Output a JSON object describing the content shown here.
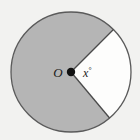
{
  "figure": {
    "type": "circle-sector-diagram",
    "background_color": "#f2f2f0",
    "labels": {
      "center_point": "O",
      "angle_variable": "x",
      "degree_symbol": "°",
      "angle_full": "x°"
    },
    "colors": {
      "shaded_sector_fill": "#b5b5b5",
      "unshaded_sector_fill": "#fdfdfc",
      "outline": "#5a5a5a",
      "radius_line": "#4a4a4a",
      "center_dot": "#111111",
      "label_text": "#1a1a1a"
    },
    "geometry": {
      "center_x": 71,
      "center_y": 72,
      "radius": 60,
      "unshaded_start_angle_deg": -45,
      "unshaded_end_angle_deg": 50,
      "unshaded_sweep_deg": 95,
      "shaded_sweep_deg": 265,
      "center_dot_radius": 4.2,
      "outline_width": 1.3,
      "radius_line_width": 1.3
    },
    "label_positions": {
      "center_label_x": 58,
      "center_label_y": 77,
      "angle_label_x": 83,
      "angle_label_y": 77
    }
  }
}
